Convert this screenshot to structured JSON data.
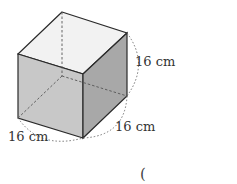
{
  "figure": {
    "shape": "cube",
    "edge_labels": {
      "height": "16 cm",
      "depth": "16 cm",
      "width": "16 cm"
    },
    "answer_paren": "("
  },
  "colors": {
    "top_face": "#f2f2f2",
    "front_face": "#c8c8c8",
    "right_face": "#a8a8a8",
    "edge": "#2a2a2a",
    "dashed": "#555555"
  }
}
